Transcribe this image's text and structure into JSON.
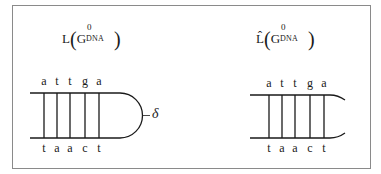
{
  "left_panel": {
    "title": {
      "op": "L",
      "open": "(",
      "base": "G",
      "sup": "0",
      "sub": "DNA",
      "close": ")"
    },
    "top_strand": [
      "a",
      "t",
      "t",
      "g",
      "a"
    ],
    "bottom_strand": [
      "t",
      "a",
      "a",
      "c",
      "t"
    ],
    "loop_label": "δ",
    "end_shape": "closed hairpin loop"
  },
  "right_panel": {
    "title": {
      "op": "L̂",
      "open": "(",
      "base": "G",
      "sup": "0",
      "sub": "DNA",
      "close": ")"
    },
    "top_strand": [
      "a",
      "t",
      "t",
      "g",
      "a"
    ],
    "bottom_strand": [
      "t",
      "a",
      "a",
      "c",
      "t"
    ],
    "end_shape": "open flared ends"
  },
  "colors": {
    "line": "#1a1a1a",
    "frame": "#8a8a8a"
  }
}
